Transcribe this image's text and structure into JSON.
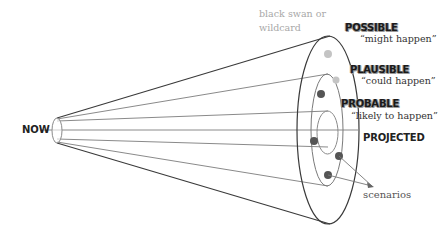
{
  "diagram": {
    "origin_label": "NOW",
    "wildcard_note": {
      "line1": "black swan or",
      "line2": "wildcard"
    },
    "categories": [
      {
        "name": "POSSIBLE",
        "quote": "“might happen”"
      },
      {
        "name": "PLAUSIBLE",
        "quote": "“could happen”"
      },
      {
        "name": "PROBABLE",
        "quote": "“likely to happen”"
      },
      {
        "name": "PROJECTED",
        "quote": ""
      }
    ],
    "scenarios_label": "scenarios",
    "colors": {
      "outline": "#3a3a3a",
      "lines": "#8a8a8a",
      "dot_dark": "#555555",
      "dot_light": "#c4c4c4",
      "note_text": "#a8a8a8"
    }
  }
}
